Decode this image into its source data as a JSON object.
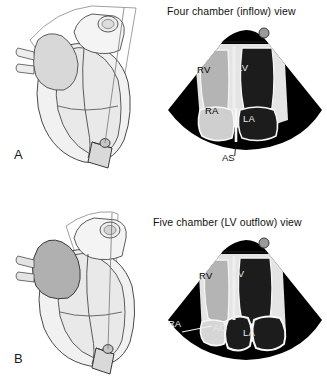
{
  "figure": {
    "type": "medical-illustration"
  },
  "panels": [
    {
      "id": "a",
      "letter": "A",
      "title": "Four chamber (inflow) view",
      "heart_diagram": {
        "name": "heart-with-scan-plane-a",
        "description": "Line drawing of the heart with an apically placed transducer and an oblique scan plane fan",
        "transducer_label": "transducer-probe",
        "scan_plane_label": "scan-plane-fan"
      },
      "sector": {
        "name": "ultrasound-sector-four-chamber",
        "orientation_marker": "sector-apex-marker-dot",
        "labels": [
          {
            "text": "RV",
            "full_name": "right ventricle",
            "placement": "inside-chamber",
            "tone": "mid-gray"
          },
          {
            "text": "LV",
            "full_name": "left ventricle",
            "placement": "inside-chamber",
            "tone": "dark"
          },
          {
            "text": "RA",
            "full_name": "right atrium",
            "placement": "inside-chamber",
            "tone": "light-gray"
          },
          {
            "text": "LA",
            "full_name": "left atrium",
            "placement": "inside-chamber",
            "tone": "dark"
          }
        ],
        "annotations": [
          {
            "text": "AS",
            "full_name": "atrial septum",
            "placement": "below-sector-with-leader-line"
          }
        ]
      }
    },
    {
      "id": "b",
      "letter": "B",
      "title": "Five chamber (LV outflow) view",
      "heart_diagram": {
        "name": "heart-with-scan-plane-b",
        "description": "Line drawing of the heart with an apically placed transducer and a steeper, more anterior scan plane fan",
        "transducer_label": "transducer-probe",
        "scan_plane_label": "scan-plane-fan"
      },
      "sector": {
        "name": "ultrasound-sector-five-chamber",
        "orientation_marker": "sector-apex-marker-dot",
        "labels": [
          {
            "text": "RV",
            "full_name": "right ventricle",
            "placement": "inside-chamber",
            "tone": "mid-gray"
          },
          {
            "text": "LV",
            "full_name": "left ventricle",
            "placement": "inside-chamber",
            "tone": "dark"
          },
          {
            "text": "AO",
            "full_name": "aorta / aortic root",
            "placement": "inside-chamber",
            "tone": "dark"
          },
          {
            "text": "LA",
            "full_name": "left atrium",
            "placement": "inside-chamber",
            "tone": "dark"
          }
        ],
        "annotations": [
          {
            "text": "RA",
            "full_name": "right atrium",
            "placement": "outside-sector-with-leader-line"
          }
        ]
      }
    }
  ],
  "colors": {
    "background": "#ffffff",
    "sector_field": "#000000",
    "text": "#111111",
    "light_text": "#f0f0f0",
    "myocardium_light": "#e6e6e6",
    "chamber_light_gray": "#cfcfcf",
    "chamber_mid_gray": "#b4b4b4",
    "chamber_dark": "#1c1c1c",
    "outline": "#555555",
    "heart_fill_light": "#f0f0f0",
    "heart_fill_mid": "#dcdcdc",
    "heart_fill_dark": "#b0b0b0",
    "marker_dot": "#9a9a9a"
  }
}
